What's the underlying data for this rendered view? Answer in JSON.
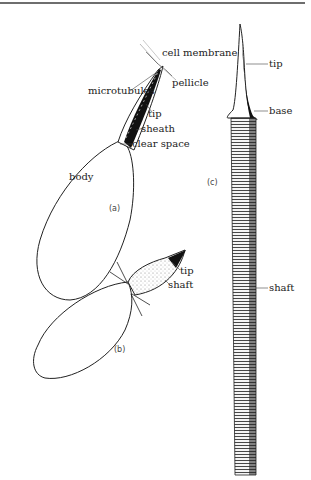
{
  "figure": {
    "panels": [
      {
        "id": "a",
        "caption": "(a)",
        "labels": {
          "cell_membrane": "cell membrane",
          "microtubules": "microtubules",
          "pellicle": "pellicle",
          "tip": "tip",
          "sheath": "sheath",
          "clear_space": "clear space",
          "body": "body"
        }
      },
      {
        "id": "b",
        "caption": "(b)",
        "labels": {
          "tip": "tip",
          "shaft": "shaft"
        }
      },
      {
        "id": "c",
        "caption": "(c)",
        "labels": {
          "tip": "tip",
          "base": "base",
          "shaft": "shaft"
        }
      }
    ]
  }
}
